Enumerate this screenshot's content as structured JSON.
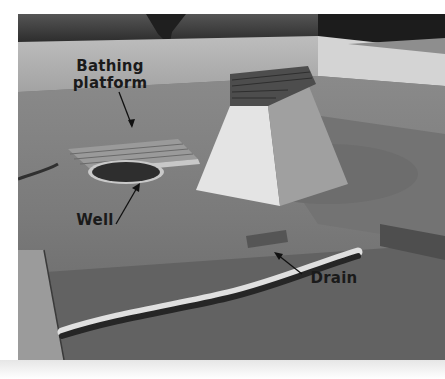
{
  "image": {
    "description": "Grayscale photograph of excavated ruins with a bathing platform, a well, a raised brick-topped structure, and a drain channel",
    "palette": {
      "sky_trees": "#2b2b2b",
      "wall": "#b8b8b8",
      "ground": "#7a7a7a",
      "ground_dark": "#5e5e5e",
      "structure_light": "#e2e2e2",
      "structure_shadow": "#9a9a9a",
      "bricks": "#4a4a4a",
      "label": "#1a1a1a"
    }
  },
  "annotations": {
    "bathing_platform": {
      "line1": "Bathing",
      "line2": "platform"
    },
    "well": {
      "text": "Well"
    },
    "drain": {
      "text": "Drain"
    }
  }
}
